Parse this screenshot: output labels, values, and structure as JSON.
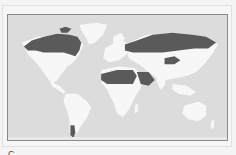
{
  "figure": {
    "type": "world choropleth map",
    "colors": {
      "ocean": "#dcdcdc",
      "land_light": "#f7f7f7",
      "land_dark": "#5a5a5a",
      "border": "#8a8a8a",
      "frame": "#e2e2e2"
    },
    "highlighted_regions": [
      "Canada",
      "Alaska",
      "Russia",
      "Mongolia",
      "North Africa (Sahara band)",
      "Arabian Peninsula",
      "Southern Argentina / Patagonia",
      "Svalbard / Arctic islands"
    ],
    "caption": {
      "visible": "partially cropped",
      "fragments": [
        "C",
        "",
        "",
        "",
        ""
      ]
    }
  }
}
